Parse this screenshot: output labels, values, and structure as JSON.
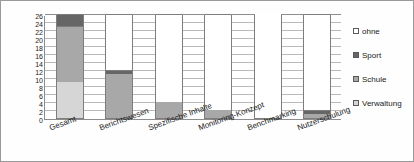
{
  "chart_data": {
    "type": "bar",
    "stacked": true,
    "title": "",
    "xlabel": "",
    "ylabel": "",
    "ylim": [
      0,
      26
    ],
    "ytick_step": 2,
    "yticks": [
      0,
      2,
      4,
      6,
      8,
      10,
      12,
      14,
      16,
      18,
      20,
      22,
      24,
      26
    ],
    "grid": true,
    "legend_position": "right",
    "categories": [
      "Gesamt",
      "Berichtswesen",
      "Spezifische Inhalte",
      "Monitoring-Konzept",
      "Benchmarking",
      "Nutzerschulung"
    ],
    "series": [
      {
        "name": "Verwaltung",
        "color": "#d6d6d6",
        "values": [
          9,
          0,
          0,
          0,
          0,
          0
        ]
      },
      {
        "name": "Schule",
        "color": "#a8a8a8",
        "values": [
          14,
          11,
          4,
          2,
          0,
          1
        ]
      },
      {
        "name": "Sport",
        "color": "#666666",
        "values": [
          3,
          1,
          0,
          0,
          0,
          1
        ]
      },
      {
        "name": "ohne",
        "color": "#ffffff",
        "values": [
          0,
          14,
          22,
          24,
          26,
          24
        ]
      }
    ],
    "totals": [
      26,
      26,
      26,
      26,
      26,
      26
    ]
  },
  "legend": {
    "items": [
      {
        "label": "ohne",
        "color": "#ffffff"
      },
      {
        "label": "Sport",
        "color": "#666666"
      },
      {
        "label": "Schule",
        "color": "#a8a8a8"
      },
      {
        "label": "Verwaltung",
        "color": "#d6d6d6"
      }
    ]
  },
  "axis": {
    "y_labels": [
      "26",
      "24",
      "22",
      "20",
      "18",
      "16",
      "14",
      "12",
      "10",
      "8",
      "6",
      "4",
      "2",
      "0"
    ]
  }
}
